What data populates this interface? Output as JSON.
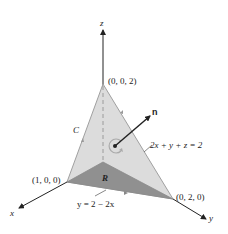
{
  "diagram": {
    "axes": {
      "x_label": "x",
      "y_label": "y",
      "z_label": "z"
    },
    "points": {
      "apex_label": "(0, 0, 2)",
      "x_intercept_label": "(1, 0, 0)",
      "y_intercept_label": "(0, 2, 0)"
    },
    "labels": {
      "curve": "C",
      "region": "R",
      "normal": "n",
      "plane_equation": "2x + y + z = 2",
      "boundary_line": "y = 2 − 2x"
    },
    "colors": {
      "surface": "#d9d9d9",
      "region": "#8f8f8f",
      "edges": "#9a9a9a",
      "axes": "#222222",
      "circulation_arrow": "#b0b0b0"
    }
  }
}
